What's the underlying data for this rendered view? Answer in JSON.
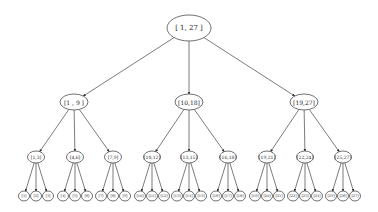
{
  "diagram": {
    "type": "tree",
    "root": {
      "label": "[ 1, 27 ]"
    },
    "level1": [
      {
        "label": "[1 , 9 ]"
      },
      {
        "label": "[10,18]"
      },
      {
        "label": "[19,27]"
      }
    ],
    "level2": [
      {
        "label": "[1,3]"
      },
      {
        "label": "[4,6]"
      },
      {
        "label": "[7,9]"
      },
      {
        "label": "[10,12]"
      },
      {
        "label": "[13,15]"
      },
      {
        "label": "[16,18]"
      },
      {
        "label": "[19,21]"
      },
      {
        "label": "[22,24]"
      },
      {
        "label": "[25,27]"
      }
    ],
    "leaves": [
      {
        "label": "[1]"
      },
      {
        "label": "[2]"
      },
      {
        "label": "[3]"
      },
      {
        "label": "[4]"
      },
      {
        "label": "[5]"
      },
      {
        "label": "[6]"
      },
      {
        "label": "[7]"
      },
      {
        "label": "[8]"
      },
      {
        "label": "[9]"
      },
      {
        "label": "[10]"
      },
      {
        "label": "[11]"
      },
      {
        "label": "[12]"
      },
      {
        "label": "[13]"
      },
      {
        "label": "[14]"
      },
      {
        "label": "[15]"
      },
      {
        "label": "[16]"
      },
      {
        "label": "[17]"
      },
      {
        "label": "[18]"
      },
      {
        "label": "[19]"
      },
      {
        "label": "[20]"
      },
      {
        "label": "[21]"
      },
      {
        "label": "[22]"
      },
      {
        "label": "[23]"
      },
      {
        "label": "[24]"
      },
      {
        "label": "[25]"
      },
      {
        "label": "[26]"
      },
      {
        "label": "[27]"
      }
    ]
  }
}
